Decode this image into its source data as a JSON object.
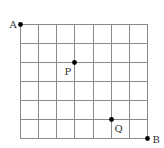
{
  "diagram": {
    "type": "grid",
    "columns": 7,
    "rows": 6,
    "origin_px": [
      20,
      24
    ],
    "cell_width_px": 18.14,
    "cell_height_px": 19,
    "line_color": "#8a8a8a",
    "point_color": "#000000",
    "points": [
      {
        "name": "A",
        "col": 0,
        "row": 0,
        "label_dx": -11,
        "label_dy": 3
      },
      {
        "name": "P",
        "col": 3,
        "row": 2,
        "label_dx": -10,
        "label_dy": 12
      },
      {
        "name": "Q",
        "col": 5,
        "row": 5,
        "label_dx": 3,
        "label_dy": 12
      },
      {
        "name": "B",
        "col": 7,
        "row": 6,
        "label_dx": 5,
        "label_dy": 4
      }
    ]
  }
}
